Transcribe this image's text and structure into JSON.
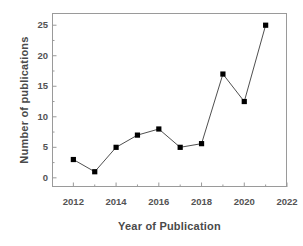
{
  "chart_data": {
    "type": "line",
    "title": "",
    "xlabel": "Year of Publication",
    "ylabel": "Number of publications",
    "x": [
      2012,
      2013,
      2014,
      2015,
      2016,
      2017,
      2018,
      2019,
      2020,
      2021
    ],
    "values": [
      3,
      1,
      5,
      7,
      8,
      5,
      5.6,
      17,
      12.5,
      25
    ],
    "series": [
      {
        "name": "Number of publications",
        "x": [
          2012,
          2013,
          2014,
          2015,
          2016,
          2017,
          2018,
          2019,
          2020,
          2021
        ],
        "values": [
          3,
          1,
          5,
          7,
          8,
          5,
          5.6,
          17,
          12.5,
          25
        ]
      }
    ],
    "xlim": [
      2011,
      2022
    ],
    "ylim": [
      -1.5,
      27
    ],
    "xticks": [
      2012,
      2014,
      2016,
      2018,
      2020,
      2022
    ],
    "xtick_labels": [
      "2012",
      "2014",
      "2016",
      "2018",
      "2020",
      "2022"
    ],
    "xminor_ticks": [
      2013,
      2015,
      2017,
      2019,
      2021
    ],
    "yticks": [
      0,
      5,
      10,
      15,
      20,
      25
    ],
    "ytick_labels": [
      "0",
      "5",
      "10",
      "15",
      "20",
      "25"
    ],
    "yminor_ticks": [
      2.5,
      7.5,
      12.5,
      17.5,
      22.5
    ],
    "grid": false,
    "legend": null,
    "marker": "square",
    "marker_color": "#000000",
    "line_color": "#3b3b3b",
    "axis_color": "#9a9a9a",
    "background_color": "#ffffff"
  }
}
